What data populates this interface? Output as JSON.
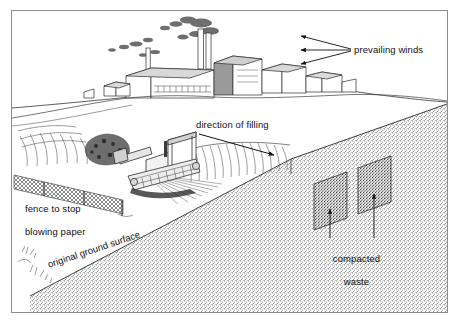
{
  "figure": {
    "kind": "cutaway-perspective-illustration",
    "frame_color": "#8c8c8c",
    "background_color": "#ffffff",
    "ink_color": "#111111"
  },
  "labels": {
    "prevailing_winds": "prevailing winds",
    "direction_of_filling": "direction of filling",
    "fence_line1": "fence to stop",
    "fence_line2": "blowing paper",
    "original_ground_surface": "original ground surface",
    "compacted_waste_line1": "compacted",
    "compacted_waste_line2": "waste"
  },
  "scene": {
    "factory": {
      "name": "industrial-plant",
      "buildings": 7,
      "smokestacks": 2,
      "smoke_drift": "left"
    },
    "bulldozer": {
      "name": "landfill-compactor",
      "count": 1
    },
    "fence": {
      "name": "litter-fence",
      "posts": 3
    },
    "waste_cells": {
      "name": "compacted-waste-cells",
      "count": 2
    },
    "wind_arrows": {
      "count": 3,
      "direction": "left"
    },
    "filling_arrow": {
      "count": 1,
      "direction": "right-down"
    },
    "waste_leader_arrows": {
      "count": 2,
      "direction": "up"
    }
  }
}
